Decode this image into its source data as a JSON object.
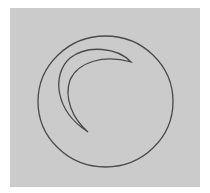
{
  "figure": {
    "background_color": "#cbcbcb",
    "stroke_color": "#4a4a4a",
    "shapes": [
      "circle",
      "crescent"
    ]
  }
}
